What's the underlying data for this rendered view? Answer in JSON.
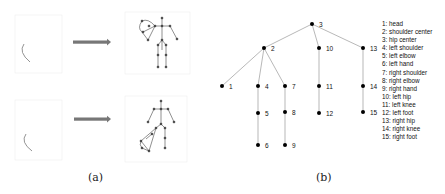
{
  "figure": {
    "panel_a": {
      "caption": "(a)",
      "rows": [
        {
          "input": "partial-arc-trajectory",
          "arrow": "arrow-right",
          "output": "skeleton-left-arm-highlighted"
        },
        {
          "input": "partial-arc-trajectory",
          "arrow": "arrow-right",
          "output": "skeleton-left-leg-highlighted"
        }
      ]
    },
    "panel_b": {
      "caption": "(b)",
      "tree": {
        "nodes": [
          {
            "id": "3",
            "x": 312,
            "y": 24
          },
          {
            "id": "2",
            "x": 264,
            "y": 48
          },
          {
            "id": "10",
            "x": 319,
            "y": 48
          },
          {
            "id": "13",
            "x": 363,
            "y": 48
          },
          {
            "id": "1",
            "x": 222,
            "y": 86
          },
          {
            "id": "4",
            "x": 258,
            "y": 86
          },
          {
            "id": "7",
            "x": 285,
            "y": 86
          },
          {
            "id": "11",
            "x": 319,
            "y": 86
          },
          {
            "id": "14",
            "x": 363,
            "y": 86
          },
          {
            "id": "5",
            "x": 258,
            "y": 113
          },
          {
            "id": "8",
            "x": 285,
            "y": 112
          },
          {
            "id": "12",
            "x": 319,
            "y": 113
          },
          {
            "id": "15",
            "x": 363,
            "y": 112
          },
          {
            "id": "6",
            "x": 258,
            "y": 145
          },
          {
            "id": "9",
            "x": 285,
            "y": 145
          }
        ],
        "edges": [
          [
            "3",
            "2"
          ],
          [
            "3",
            "10"
          ],
          [
            "3",
            "13"
          ],
          [
            "2",
            "1"
          ],
          [
            "2",
            "4"
          ],
          [
            "2",
            "7"
          ],
          [
            "4",
            "5"
          ],
          [
            "5",
            "6"
          ],
          [
            "7",
            "8"
          ],
          [
            "8",
            "9"
          ],
          [
            "10",
            "11"
          ],
          [
            "11",
            "12"
          ],
          [
            "13",
            "14"
          ],
          [
            "14",
            "15"
          ]
        ]
      },
      "legend": [
        "1: head",
        "2: shoulder center",
        "3: hip center",
        "4: left shoulder",
        "5: left elbow",
        "6: left hand",
        "7: right shoulder",
        "8: right elbow",
        "9: right hand",
        "10: left hip",
        "11: left knee",
        "12: left foot",
        "13: right hip",
        "14: right knee",
        "15: right foot"
      ]
    }
  }
}
